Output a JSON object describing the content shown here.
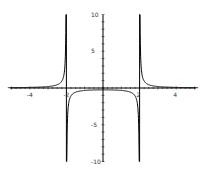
{
  "chart_data": {
    "type": "line",
    "title": "",
    "xlabel": "",
    "ylabel": "",
    "function": "1/(x^2-4)",
    "xlim": [
      -5.2,
      5.2
    ],
    "ylim": [
      -10,
      10
    ],
    "grid": false,
    "legend": null,
    "x_ticks": [
      -4,
      -2,
      2,
      4
    ],
    "x_tick_labels": [
      "-4",
      "-2",
      "2",
      "4"
    ],
    "y_ticks": [
      10,
      5,
      -5,
      -10
    ],
    "y_tick_labels": [
      "10",
      "5",
      "-5",
      "-10"
    ],
    "vertical_asymptotes": [
      -2,
      2
    ],
    "series": [
      {
        "name": "f(x)",
        "color": "#000000",
        "x": [
          -5.2,
          -4,
          -3,
          -2.5,
          -2.2,
          -2.05,
          -1.95,
          -1.5,
          -1,
          0,
          1,
          1.5,
          1.95,
          2.05,
          2.2,
          2.5,
          3,
          4,
          5.2
        ],
        "values": [
          0.04,
          0.083,
          0.2,
          0.444,
          1.19,
          4.94,
          -5.06,
          -0.571,
          -0.333,
          -0.25,
          -0.333,
          -0.571,
          -5.06,
          4.94,
          1.19,
          0.444,
          0.2,
          0.083,
          0.04
        ]
      }
    ]
  },
  "axes": {
    "x_labels": [
      "-4",
      "-2",
      "2",
      "4"
    ],
    "y_labels": [
      "10",
      "5",
      "-5",
      "-10"
    ]
  }
}
